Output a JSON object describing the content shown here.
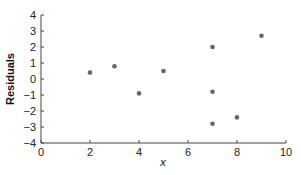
{
  "chart_data": {
    "type": "scatter",
    "title": "",
    "xlabel": "x",
    "ylabel": "Residuals",
    "xlim": [
      0,
      10
    ],
    "ylim": [
      -4,
      4
    ],
    "xticks": [
      0,
      2,
      4,
      6,
      8,
      10
    ],
    "yticks": [
      4,
      3,
      2,
      1,
      0,
      -1,
      -2,
      -3,
      -4
    ],
    "grid": false,
    "legend": null,
    "marker_color": "#666666",
    "series": [
      {
        "name": "Residuals",
        "points": [
          {
            "x": 2,
            "y": 0.4
          },
          {
            "x": 3,
            "y": 0.8
          },
          {
            "x": 4,
            "y": -0.9
          },
          {
            "x": 5,
            "y": 0.5
          },
          {
            "x": 7,
            "y": 2.0
          },
          {
            "x": 7,
            "y": -0.8
          },
          {
            "x": 7,
            "y": -2.8
          },
          {
            "x": 8,
            "y": -2.4
          },
          {
            "x": 9,
            "y": 2.7
          }
        ]
      }
    ]
  }
}
